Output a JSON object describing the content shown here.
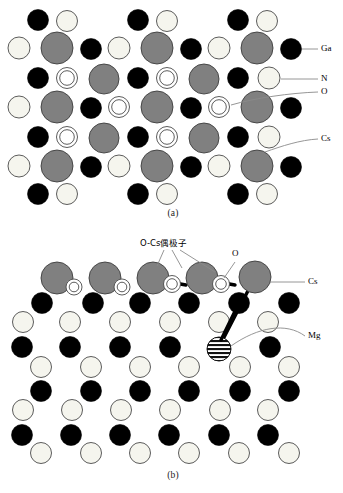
{
  "figure": {
    "panels": [
      {
        "id": "a",
        "caption": "(a)"
      },
      {
        "id": "b",
        "caption": "(b)"
      }
    ]
  },
  "legend_a": {
    "items": [
      {
        "key": "ga",
        "label": "Ga",
        "color": "#000000",
        "desc": "filled black circle"
      },
      {
        "key": "n",
        "label": "N",
        "color": "#f7f7f0",
        "desc": "open white circle"
      },
      {
        "key": "o",
        "label": "O",
        "color": "#ffffff",
        "desc": "double ring circle"
      },
      {
        "key": "cs",
        "label": "Cs",
        "color": "#808080",
        "desc": "large gray circle"
      }
    ]
  },
  "legend_b": {
    "items": [
      {
        "key": "o",
        "label": "O",
        "color": "#ffffff",
        "desc": "small white circle"
      },
      {
        "key": "cs",
        "label": "Cs",
        "color": "#808080",
        "desc": "large gray circle"
      },
      {
        "key": "mg",
        "label": "Mg",
        "color": "#000000",
        "desc": "horizontally hatched circle"
      }
    ],
    "dipole_label": "O-Cs偶极子"
  },
  "colors": {
    "ga": "#000000",
    "n": "#f5f5ee",
    "o": "#ffffff",
    "cs": "#808080",
    "cs_stroke": "#3d3d3d",
    "mg_stripe": "#111111",
    "outline": "#4a4a4a",
    "leader": "#8a8a8a",
    "bond": "#000000",
    "background": "#ffffff"
  },
  "chart_data": {
    "type": "scatter",
    "xlabel": "",
    "ylabel": "",
    "panel_a": {
      "caption": "(a)",
      "description": "Cs/O co-adsorbed GaN (0001) surface cross-section lattice",
      "atoms": [
        {
          "el": "Ga",
          "x": 38,
          "y": 20,
          "r": 10.5
        },
        {
          "el": "N",
          "x": 67,
          "y": 21,
          "r": 10.5
        },
        {
          "el": "Ga",
          "x": 138,
          "y": 20,
          "r": 10.5
        },
        {
          "el": "N",
          "x": 167,
          "y": 21,
          "r": 10.5
        },
        {
          "el": "Ga",
          "x": 238,
          "y": 20,
          "r": 10.5
        },
        {
          "el": "N",
          "x": 267,
          "y": 21,
          "r": 10.5
        },
        {
          "el": "N",
          "x": 19,
          "y": 48,
          "r": 11
        },
        {
          "el": "Cs",
          "x": 57,
          "y": 48,
          "r": 16
        },
        {
          "el": "Ga",
          "x": 91,
          "y": 49,
          "r": 10.5
        },
        {
          "el": "N",
          "x": 119,
          "y": 48,
          "r": 11
        },
        {
          "el": "Cs",
          "x": 157,
          "y": 48,
          "r": 16
        },
        {
          "el": "Ga",
          "x": 191,
          "y": 49,
          "r": 10.5
        },
        {
          "el": "N",
          "x": 219,
          "y": 48,
          "r": 11
        },
        {
          "el": "Cs",
          "x": 257,
          "y": 48,
          "r": 16
        },
        {
          "el": "Ga",
          "x": 291,
          "y": 49,
          "r": 10.5
        },
        {
          "el": "Ga",
          "x": 38,
          "y": 78,
          "r": 10.5
        },
        {
          "el": "O",
          "x": 67,
          "y": 78,
          "r": 10.5
        },
        {
          "el": "Cs",
          "x": 104,
          "y": 79,
          "r": 15
        },
        {
          "el": "Ga",
          "x": 138,
          "y": 78,
          "r": 10.5
        },
        {
          "el": "O",
          "x": 167,
          "y": 78,
          "r": 10.5
        },
        {
          "el": "Cs",
          "x": 204,
          "y": 79,
          "r": 15
        },
        {
          "el": "Ga",
          "x": 238,
          "y": 78,
          "r": 10.5
        },
        {
          "el": "N",
          "x": 269,
          "y": 78,
          "r": 11
        },
        {
          "el": "N",
          "x": 19,
          "y": 107,
          "r": 11
        },
        {
          "el": "Cs",
          "x": 57,
          "y": 107,
          "r": 16
        },
        {
          "el": "Ga",
          "x": 91,
          "y": 108,
          "r": 10.5
        },
        {
          "el": "O",
          "x": 119,
          "y": 107,
          "r": 10.5
        },
        {
          "el": "Cs",
          "x": 157,
          "y": 107,
          "r": 16
        },
        {
          "el": "Ga",
          "x": 191,
          "y": 108,
          "r": 10.5
        },
        {
          "el": "O",
          "x": 219,
          "y": 107,
          "r": 10.5
        },
        {
          "el": "Cs",
          "x": 257,
          "y": 107,
          "r": 16
        },
        {
          "el": "Ga",
          "x": 291,
          "y": 108,
          "r": 10.5
        },
        {
          "el": "Ga",
          "x": 38,
          "y": 137,
          "r": 10.5
        },
        {
          "el": "O",
          "x": 67,
          "y": 137,
          "r": 10.5
        },
        {
          "el": "Cs",
          "x": 104,
          "y": 138,
          "r": 15
        },
        {
          "el": "Ga",
          "x": 138,
          "y": 137,
          "r": 10.5
        },
        {
          "el": "O",
          "x": 167,
          "y": 137,
          "r": 10.5
        },
        {
          "el": "Cs",
          "x": 204,
          "y": 138,
          "r": 15
        },
        {
          "el": "Ga",
          "x": 238,
          "y": 137,
          "r": 10.5
        },
        {
          "el": "N",
          "x": 269,
          "y": 137,
          "r": 11
        },
        {
          "el": "N",
          "x": 19,
          "y": 166,
          "r": 11
        },
        {
          "el": "Cs",
          "x": 57,
          "y": 166,
          "r": 16
        },
        {
          "el": "Ga",
          "x": 91,
          "y": 167,
          "r": 10.5
        },
        {
          "el": "N",
          "x": 119,
          "y": 166,
          "r": 11
        },
        {
          "el": "Cs",
          "x": 157,
          "y": 166,
          "r": 16
        },
        {
          "el": "Ga",
          "x": 191,
          "y": 167,
          "r": 10.5
        },
        {
          "el": "N",
          "x": 219,
          "y": 166,
          "r": 11
        },
        {
          "el": "Cs",
          "x": 257,
          "y": 166,
          "r": 16
        },
        {
          "el": "Ga",
          "x": 291,
          "y": 167,
          "r": 10.5
        },
        {
          "el": "Ga",
          "x": 38,
          "y": 194,
          "r": 10.5
        },
        {
          "el": "N",
          "x": 67,
          "y": 194,
          "r": 10.5
        },
        {
          "el": "Ga",
          "x": 138,
          "y": 194,
          "r": 10.5
        },
        {
          "el": "N",
          "x": 167,
          "y": 194,
          "r": 10.5
        },
        {
          "el": "Ga",
          "x": 238,
          "y": 194,
          "r": 10.5
        },
        {
          "el": "N",
          "x": 267,
          "y": 194,
          "r": 10.5
        }
      ]
    },
    "panel_b": {
      "caption": "(b)",
      "description": "Cs-O dipole layer on GaN surface with Mg dopant",
      "dipole_pairs": 2,
      "atoms": [
        {
          "el": "Cs",
          "x": 57,
          "y": 278,
          "r": 16
        },
        {
          "el": "O",
          "x": 74,
          "y": 287,
          "r": 8
        },
        {
          "el": "Cs",
          "x": 105,
          "y": 278,
          "r": 16
        },
        {
          "el": "O",
          "x": 122,
          "y": 287,
          "r": 8
        },
        {
          "el": "Cs",
          "x": 153,
          "y": 278,
          "r": 16
        },
        {
          "el": "O",
          "x": 172,
          "y": 284,
          "r": 8.5
        },
        {
          "el": "Cs",
          "x": 202,
          "y": 278,
          "r": 16
        },
        {
          "el": "O",
          "x": 221,
          "y": 284,
          "r": 8.5
        },
        {
          "el": "Cs",
          "x": 255,
          "y": 277,
          "r": 16
        },
        {
          "el": "Ga",
          "x": 42,
          "y": 303,
          "r": 10.5
        },
        {
          "el": "Ga",
          "x": 93,
          "y": 303,
          "r": 10.5
        },
        {
          "el": "Ga",
          "x": 140,
          "y": 303,
          "r": 10.5
        },
        {
          "el": "Ga",
          "x": 189,
          "y": 303,
          "r": 10.5
        },
        {
          "el": "Ga",
          "x": 239,
          "y": 303,
          "r": 10.5
        },
        {
          "el": "Ga",
          "x": 289,
          "y": 303,
          "r": 10.5
        },
        {
          "el": "N",
          "x": 23,
          "y": 322,
          "r": 10.5
        },
        {
          "el": "N",
          "x": 70,
          "y": 322,
          "r": 10.5
        },
        {
          "el": "N",
          "x": 120,
          "y": 322,
          "r": 10.5
        },
        {
          "el": "N",
          "x": 170,
          "y": 322,
          "r": 10.5
        },
        {
          "el": "N",
          "x": 219,
          "y": 322,
          "r": 10.5
        },
        {
          "el": "N",
          "x": 268,
          "y": 322,
          "r": 10.5
        },
        {
          "el": "Ga",
          "x": 22,
          "y": 347,
          "r": 10.5
        },
        {
          "el": "Ga",
          "x": 70,
          "y": 347,
          "r": 10.5
        },
        {
          "el": "Ga",
          "x": 120,
          "y": 347,
          "r": 10.5
        },
        {
          "el": "Ga",
          "x": 170,
          "y": 347,
          "r": 10.5
        },
        {
          "el": "Mg",
          "x": 219,
          "y": 349,
          "r": 12
        },
        {
          "el": "Ga",
          "x": 270,
          "y": 347,
          "r": 10.5
        },
        {
          "el": "N",
          "x": 41,
          "y": 367,
          "r": 10.5
        },
        {
          "el": "N",
          "x": 91,
          "y": 367,
          "r": 10.5
        },
        {
          "el": "N",
          "x": 140,
          "y": 367,
          "r": 10.5
        },
        {
          "el": "N",
          "x": 189,
          "y": 367,
          "r": 10.5
        },
        {
          "el": "N",
          "x": 240,
          "y": 367,
          "r": 10.5
        },
        {
          "el": "N",
          "x": 289,
          "y": 367,
          "r": 10.5
        },
        {
          "el": "Ga",
          "x": 41,
          "y": 391,
          "r": 10.5
        },
        {
          "el": "Ga",
          "x": 91,
          "y": 391,
          "r": 10.5
        },
        {
          "el": "Ga",
          "x": 140,
          "y": 391,
          "r": 10.5
        },
        {
          "el": "Ga",
          "x": 189,
          "y": 391,
          "r": 10.5
        },
        {
          "el": "Ga",
          "x": 240,
          "y": 391,
          "r": 10.5
        },
        {
          "el": "Ga",
          "x": 289,
          "y": 391,
          "r": 10.5
        },
        {
          "el": "N",
          "x": 23,
          "y": 410,
          "r": 10.5
        },
        {
          "el": "N",
          "x": 72,
          "y": 410,
          "r": 10.5
        },
        {
          "el": "N",
          "x": 121,
          "y": 410,
          "r": 10.5
        },
        {
          "el": "N",
          "x": 170,
          "y": 410,
          "r": 10.5
        },
        {
          "el": "N",
          "x": 220,
          "y": 410,
          "r": 10.5
        },
        {
          "el": "N",
          "x": 268,
          "y": 410,
          "r": 10.5
        },
        {
          "el": "Ga",
          "x": 22,
          "y": 435,
          "r": 10.5
        },
        {
          "el": "Ga",
          "x": 71,
          "y": 435,
          "r": 10.5
        },
        {
          "el": "Ga",
          "x": 120,
          "y": 435,
          "r": 10.5
        },
        {
          "el": "Ga",
          "x": 169,
          "y": 435,
          "r": 10.5
        },
        {
          "el": "Ga",
          "x": 219,
          "y": 435,
          "r": 10.5
        },
        {
          "el": "Ga",
          "x": 268,
          "y": 435,
          "r": 10.5
        },
        {
          "el": "N",
          "x": 41,
          "y": 453,
          "r": 10.5
        },
        {
          "el": "N",
          "x": 91,
          "y": 453,
          "r": 10.5
        },
        {
          "el": "N",
          "x": 140,
          "y": 453,
          "r": 10.5
        },
        {
          "el": "N",
          "x": 189,
          "y": 453,
          "r": 10.5
        },
        {
          "el": "N",
          "x": 239,
          "y": 453,
          "r": 10.5
        },
        {
          "el": "N",
          "x": 289,
          "y": 453,
          "r": 10.5
        }
      ]
    }
  }
}
